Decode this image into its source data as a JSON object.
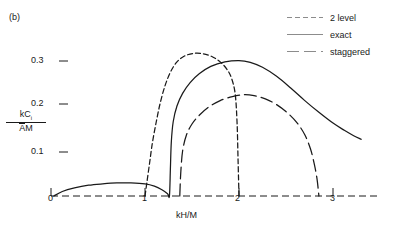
{
  "panel": {
    "label": "(b)"
  },
  "legend": {
    "position": "top-right",
    "entries": [
      {
        "label": "2 level",
        "style": "dashed-short",
        "dash": "5,3"
      },
      {
        "label": "exact",
        "style": "solid",
        "dash": "none"
      },
      {
        "label": "staggered",
        "style": "dashed-long",
        "dash": "12,5"
      }
    ]
  },
  "axes": {
    "xlabel": "kH/M",
    "ylabel_numerator": "kC",
    "ylabel_numerator_sub": "i",
    "ylabel_denominator_over": "A",
    "ylabel_denominator_rest": "M",
    "xticks": [
      "0",
      "1",
      "2",
      "3"
    ],
    "yticks": [
      "0.3",
      "0.2",
      "0.1"
    ]
  },
  "colors": {
    "ink": "#1a1a1a",
    "background": "#ffffff"
  },
  "chart_data": {
    "type": "line",
    "title": "",
    "subtitle": "(b)",
    "xlabel": "kH/M",
    "ylabel": "kC_i / ĀM",
    "xlim": [
      0,
      3.35
    ],
    "ylim": [
      0,
      0.345
    ],
    "xticks": [
      0,
      1,
      2,
      3
    ],
    "yticks": [
      0.1,
      0.2,
      0.3
    ],
    "grid": false,
    "legend_position": "top-right",
    "series": [
      {
        "name": "2 level",
        "style": "dashed-short",
        "points": [
          [
            1.0,
            0.0
          ],
          [
            1.02,
            0.03
          ],
          [
            1.05,
            0.075
          ],
          [
            1.08,
            0.12
          ],
          [
            1.12,
            0.165
          ],
          [
            1.16,
            0.205
          ],
          [
            1.21,
            0.243
          ],
          [
            1.27,
            0.275
          ],
          [
            1.34,
            0.298
          ],
          [
            1.42,
            0.311
          ],
          [
            1.52,
            0.317
          ],
          [
            1.62,
            0.316
          ],
          [
            1.72,
            0.309
          ],
          [
            1.8,
            0.298
          ],
          [
            1.87,
            0.282
          ],
          [
            1.92,
            0.262
          ],
          [
            1.96,
            0.226
          ],
          [
            1.98,
            0.16
          ],
          [
            1.99,
            0.08
          ],
          [
            2.0,
            0.0
          ]
        ]
      },
      {
        "name": "exact",
        "style": "solid",
        "points": [
          [
            0.03,
            0.0
          ],
          [
            0.12,
            0.01
          ],
          [
            0.25,
            0.018
          ],
          [
            0.4,
            0.024
          ],
          [
            0.55,
            0.027
          ],
          [
            0.7,
            0.029
          ],
          [
            0.85,
            0.029
          ],
          [
            1.0,
            0.027
          ],
          [
            1.1,
            0.022
          ],
          [
            1.18,
            0.014
          ],
          [
            1.24,
            0.005
          ],
          [
            1.26,
            0.0
          ],
          [
            1.27,
            0.06
          ],
          [
            1.28,
            0.12
          ],
          [
            1.3,
            0.165
          ],
          [
            1.34,
            0.2
          ],
          [
            1.4,
            0.228
          ],
          [
            1.48,
            0.252
          ],
          [
            1.58,
            0.272
          ],
          [
            1.7,
            0.288
          ],
          [
            1.85,
            0.298
          ],
          [
            2.0,
            0.301
          ],
          [
            2.12,
            0.297
          ],
          [
            2.25,
            0.286
          ],
          [
            2.4,
            0.266
          ],
          [
            2.55,
            0.24
          ],
          [
            2.7,
            0.212
          ],
          [
            2.85,
            0.186
          ],
          [
            3.0,
            0.162
          ],
          [
            3.12,
            0.146
          ],
          [
            3.22,
            0.134
          ],
          [
            3.3,
            0.126
          ]
        ]
      },
      {
        "name": "staggered",
        "style": "dashed-long",
        "points": [
          [
            1.37,
            0.0
          ],
          [
            1.38,
            0.05
          ],
          [
            1.4,
            0.1
          ],
          [
            1.44,
            0.135
          ],
          [
            1.5,
            0.16
          ],
          [
            1.58,
            0.18
          ],
          [
            1.68,
            0.198
          ],
          [
            1.8,
            0.212
          ],
          [
            1.93,
            0.221
          ],
          [
            2.05,
            0.225
          ],
          [
            2.16,
            0.223
          ],
          [
            2.28,
            0.216
          ],
          [
            2.4,
            0.203
          ],
          [
            2.52,
            0.184
          ],
          [
            2.62,
            0.162
          ],
          [
            2.7,
            0.136
          ],
          [
            2.76,
            0.105
          ],
          [
            2.8,
            0.072
          ],
          [
            2.83,
            0.038
          ],
          [
            2.85,
            0.0
          ]
        ]
      }
    ]
  }
}
